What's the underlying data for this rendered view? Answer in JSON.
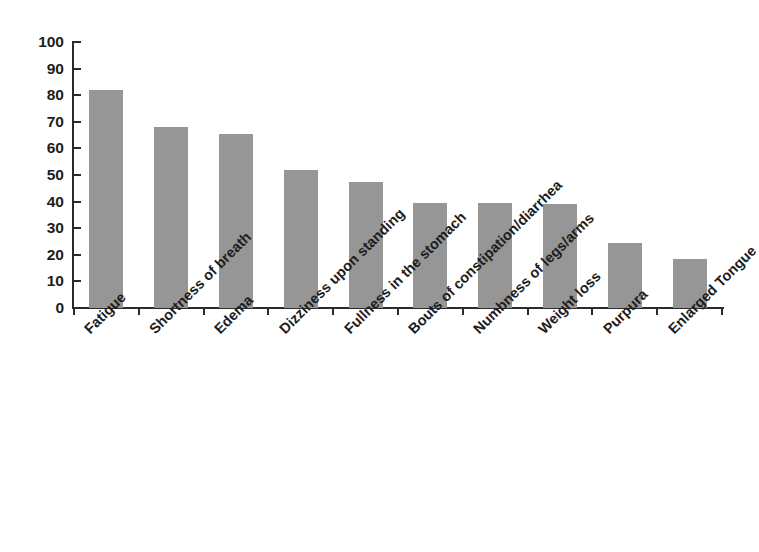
{
  "chart_data": {
    "type": "bar",
    "title": "",
    "subtitle": "",
    "xlabel": "",
    "ylabel": "",
    "ylim": [
      0,
      100
    ],
    "ytick_step": 10,
    "yticks": [
      100,
      90,
      80,
      70,
      60,
      50,
      40,
      30,
      20,
      10,
      0
    ],
    "grid": false,
    "legend": false,
    "legend_position": "none",
    "orientation": "vertical",
    "bar_color": "#969696",
    "axis_color": "#2b2b2b",
    "xtick_label_rotation": -45,
    "categories": [
      "Fatigue",
      "Shortness of breath",
      "Edema",
      "Dizziness upon standing",
      "Fullness in the stomach",
      "Bouts of constipation/diarrhea",
      "Numbness of legs/arms",
      "Weight loss",
      "Purpura",
      "Enlarged Tongue"
    ],
    "values": [
      82,
      68,
      65.5,
      52,
      47.5,
      39.5,
      39.5,
      39,
      24.5,
      18.5
    ],
    "series": [
      {
        "name": "",
        "values": [
          82,
          68,
          65.5,
          52,
          47.5,
          39.5,
          39.5,
          39,
          24.5,
          18.5
        ]
      }
    ]
  }
}
